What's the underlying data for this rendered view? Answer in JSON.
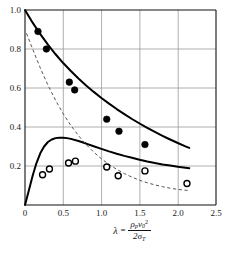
{
  "chart_data": {
    "type": "scatter",
    "title": "",
    "xlabel": "lambda = rho_p * v_0^2 / (2 * sigma_T)",
    "ylabel": "",
    "xlim": [
      0,
      2.5
    ],
    "ylim": [
      0,
      1.0
    ],
    "grid": true,
    "legend": "none",
    "xticks": [
      "0",
      "0.5",
      "1.0",
      "1.5",
      "2.0",
      "2.5"
    ],
    "xtick_values": [
      0,
      0.5,
      1.0,
      1.5,
      2.0,
      2.5
    ],
    "yticks": [
      "0.2",
      "0.4",
      "0.6",
      "0.8",
      "1.0"
    ],
    "ytick_values": [
      0.2,
      0.4,
      0.6,
      0.8,
      1.0
    ],
    "series": [
      {
        "name": "upper-solid-curve",
        "type": "line",
        "style": "solid",
        "color": "#000000",
        "x": [
          0.0,
          0.1,
          0.2,
          0.3,
          0.4,
          0.5,
          0.6,
          0.7,
          0.8,
          0.9,
          1.0,
          1.1,
          1.2,
          1.3,
          1.4,
          1.5,
          1.6,
          1.7,
          1.8,
          1.9,
          2.0,
          2.1,
          2.15
        ],
        "y": [
          1.0,
          0.935,
          0.876,
          0.822,
          0.773,
          0.728,
          0.687,
          0.649,
          0.613,
          0.58,
          0.549,
          0.52,
          0.492,
          0.466,
          0.441,
          0.418,
          0.396,
          0.375,
          0.355,
          0.336,
          0.318,
          0.301,
          0.293
        ]
      },
      {
        "name": "lower-solid-curve",
        "type": "line",
        "style": "solid",
        "color": "#000000",
        "x": [
          0.0,
          0.05,
          0.1,
          0.15,
          0.2,
          0.25,
          0.3,
          0.35,
          0.4,
          0.45,
          0.5,
          0.55,
          0.6,
          0.7,
          0.8,
          0.9,
          1.0,
          1.1,
          1.2,
          1.3,
          1.4,
          1.5,
          1.6,
          1.7,
          1.8,
          1.9,
          2.0,
          2.1,
          2.15
        ],
        "y": [
          0.0,
          0.075,
          0.15,
          0.215,
          0.265,
          0.3,
          0.323,
          0.336,
          0.343,
          0.345,
          0.345,
          0.343,
          0.339,
          0.328,
          0.315,
          0.301,
          0.288,
          0.275,
          0.263,
          0.252,
          0.242,
          0.232,
          0.223,
          0.215,
          0.208,
          0.202,
          0.196,
          0.191,
          0.189
        ]
      },
      {
        "name": "dashed-curve",
        "type": "line",
        "style": "dashed",
        "color": "#555555",
        "x": [
          0.02,
          0.1,
          0.2,
          0.3,
          0.4,
          0.5,
          0.6,
          0.7,
          0.8,
          0.9,
          1.0,
          1.1,
          1.2,
          1.3,
          1.4,
          1.5,
          1.6,
          1.7,
          1.8,
          1.9,
          2.0,
          2.1,
          2.15
        ],
        "y": [
          0.88,
          0.8,
          0.703,
          0.615,
          0.537,
          0.468,
          0.408,
          0.356,
          0.31,
          0.271,
          0.237,
          0.208,
          0.183,
          0.161,
          0.143,
          0.127,
          0.114,
          0.103,
          0.094,
          0.086,
          0.08,
          0.076,
          0.074
        ]
      },
      {
        "name": "filled-circle-data",
        "type": "scatter",
        "marker": "filled-circle",
        "color": "#000000",
        "points": [
          [
            0.17,
            0.89
          ],
          [
            0.28,
            0.8
          ],
          [
            0.58,
            0.63
          ],
          [
            0.65,
            0.59
          ],
          [
            1.07,
            0.44
          ],
          [
            1.23,
            0.378
          ],
          [
            1.57,
            0.31
          ]
        ]
      },
      {
        "name": "open-circle-data",
        "type": "scatter",
        "marker": "open-circle",
        "color": "#000000",
        "points": [
          [
            0.23,
            0.155
          ],
          [
            0.32,
            0.185
          ],
          [
            0.57,
            0.215
          ],
          [
            0.66,
            0.225
          ],
          [
            1.07,
            0.195
          ],
          [
            1.22,
            0.15
          ],
          [
            1.57,
            0.175
          ],
          [
            2.12,
            0.11
          ]
        ]
      }
    ]
  },
  "axis_formula": {
    "lambda": "λ",
    "equals": "=",
    "numerator_rho": "ρ",
    "numerator_rho_sub": "p",
    "numerator_v": "v",
    "numerator_v_sub": "0",
    "numerator_v_sup": "2",
    "denominator_two": "2",
    "denominator_sigma": "σ",
    "denominator_sigma_sub": "T"
  }
}
